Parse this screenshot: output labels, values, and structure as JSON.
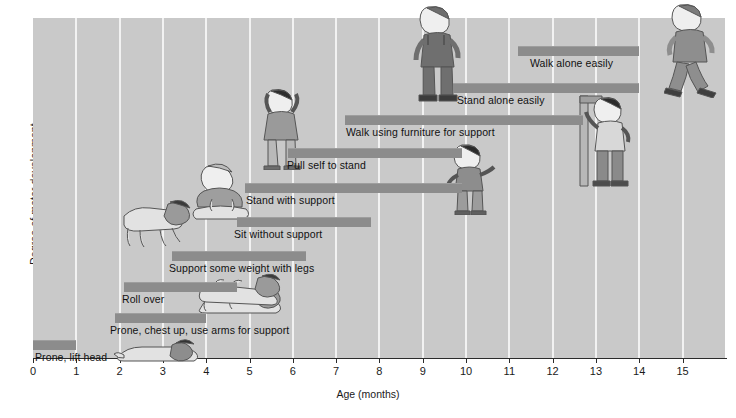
{
  "chart_data": {
    "type": "bar",
    "orientation": "horizontal-range",
    "title": "",
    "xlabel": "Age (months)",
    "ylabel": "Degree of motor development",
    "xlim": [
      0,
      16
    ],
    "xticks": [
      0,
      1,
      2,
      3,
      4,
      5,
      6,
      7,
      8,
      9,
      10,
      11,
      12,
      13,
      14,
      15
    ],
    "xtick_labels": [
      "0",
      "1",
      "2",
      "3",
      "4",
      "5",
      "6",
      "7",
      "8",
      "9",
      "10",
      "11",
      "12",
      "13",
      "14",
      "15"
    ],
    "grid": "vertical gridlines at each month",
    "legend": "none",
    "bar_color": "#8c8c8c",
    "plot_background": "#c9c9c9",
    "categories": [
      "Prone, lift head",
      "Prone, chest up, use arms for support",
      "Roll over",
      "Support some weight with legs",
      "Sit without support",
      "Stand with support",
      "Pull self to stand",
      "Walk using furniture for support",
      "Stand alone easily",
      "Walk alone easily"
    ],
    "series": [
      {
        "name": "Age range of milestone attainment (months)",
        "ranges": [
          {
            "label": "Prone, lift head",
            "start": 0.0,
            "end": 1.0
          },
          {
            "label": "Prone, chest up, use arms for support",
            "start": 1.9,
            "end": 4.0
          },
          {
            "label": "Roll over",
            "start": 2.1,
            "end": 4.7
          },
          {
            "label": "Support some weight with legs",
            "start": 3.2,
            "end": 6.3
          },
          {
            "label": "Sit without support",
            "start": 4.7,
            "end": 7.8
          },
          {
            "label": "Stand with support",
            "start": 4.9,
            "end": 9.9
          },
          {
            "label": "Pull self to stand",
            "start": 5.9,
            "end": 9.9
          },
          {
            "label": "Walk using furniture for support",
            "start": 7.2,
            "end": 12.7
          },
          {
            "label": "Stand alone easily",
            "start": 9.7,
            "end": 14.0
          },
          {
            "label": "Walk alone easily",
            "start": 11.2,
            "end": 14.0
          }
        ]
      }
    ]
  },
  "axes": {
    "x_title": "Age (months)",
    "y_title": "Degree of motor development",
    "ticks": [
      "0",
      "1",
      "2",
      "3",
      "4",
      "5",
      "6",
      "7",
      "8",
      "9",
      "10",
      "11",
      "12",
      "13",
      "14",
      "15"
    ]
  },
  "milestones": [
    {
      "label": "Prone, lift head",
      "start": 0.0,
      "end": 1.0,
      "label_x": 35,
      "label_y": 351,
      "bar_y": 340
    },
    {
      "label": "Prone, chest up, use arms for support",
      "start": 1.9,
      "end": 4.0,
      "label_x": 110,
      "label_y": 324,
      "bar_y": 313
    },
    {
      "label": "Roll over",
      "start": 2.1,
      "end": 4.7,
      "label_x": 122,
      "label_y": 293,
      "bar_y": 282
    },
    {
      "label": "Support some weight with legs",
      "start": 3.2,
      "end": 6.3,
      "label_x": 169,
      "label_y": 262,
      "bar_y": 251
    },
    {
      "label": "Sit without support",
      "start": 4.7,
      "end": 7.8,
      "label_x": 234,
      "label_y": 228,
      "bar_y": 217
    },
    {
      "label": "Stand with support",
      "start": 4.9,
      "end": 9.9,
      "label_x": 246,
      "label_y": 194,
      "bar_y": 183
    },
    {
      "label": "Pull self to stand",
      "start": 5.9,
      "end": 9.9,
      "label_x": 287,
      "label_y": 159,
      "bar_y": 148
    },
    {
      "label": "Walk using furniture for support",
      "start": 7.2,
      "end": 12.7,
      "label_x": 346,
      "label_y": 126,
      "bar_y": 115
    },
    {
      "label": "Stand alone easily",
      "start": 9.7,
      "end": 14.0,
      "label_x": 457,
      "label_y": 94,
      "bar_y": 83
    },
    {
      "label": "Walk alone easily",
      "start": 11.2,
      "end": 14.0,
      "label_x": 530,
      "label_y": 57,
      "bar_y": 46
    }
  ],
  "figures": [
    {
      "name": "infant-prone-lift-head",
      "x": 112,
      "y": 333,
      "w": 96,
      "h": 30
    },
    {
      "name": "infant-prone-chest-up",
      "x": 196,
      "y": 281,
      "w": 96,
      "h": 34
    },
    {
      "name": "infant-rolling-over",
      "x": 196,
      "y": 272,
      "w": 96,
      "h": 34
    },
    {
      "name": "infant-crawling",
      "x": 110,
      "y": 198,
      "w": 86,
      "h": 52
    },
    {
      "name": "infant-sitting",
      "x": 192,
      "y": 163,
      "w": 62,
      "h": 62
    },
    {
      "name": "toddler-pull-to-stand",
      "x": 258,
      "y": 88,
      "w": 48,
      "h": 82
    },
    {
      "name": "toddler-standing-pointing",
      "x": 444,
      "y": 143,
      "w": 52,
      "h": 72
    },
    {
      "name": "toddler-standing-alone",
      "x": 410,
      "y": 4,
      "w": 56,
      "h": 98
    },
    {
      "name": "toddler-cruising-furniture",
      "x": 578,
      "y": 92,
      "w": 56,
      "h": 96
    },
    {
      "name": "toddler-walking-alone",
      "x": 664,
      "y": 2,
      "w": 58,
      "h": 96
    }
  ]
}
